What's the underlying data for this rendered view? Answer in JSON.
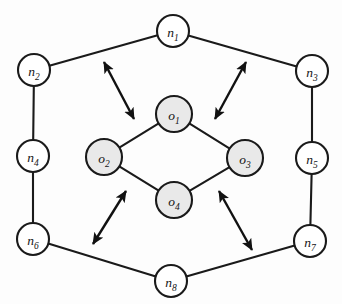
{
  "diagram": {
    "colors": {
      "outer_node_fill": "#ffffff",
      "inner_node_fill": "#e9e9e9",
      "stroke": "#1a1a1a",
      "arrow": "#111111",
      "background": "#fdfdfd"
    },
    "outer_nodes": [
      {
        "id": "n1",
        "base": "n",
        "sub": "1",
        "cx": 173,
        "cy": 31,
        "r": 16
      },
      {
        "id": "n2",
        "base": "n",
        "sub": "2",
        "cx": 34,
        "cy": 70,
        "r": 16
      },
      {
        "id": "n3",
        "base": "n",
        "sub": "3",
        "cx": 312,
        "cy": 71,
        "r": 16
      },
      {
        "id": "n4",
        "base": "n",
        "sub": "4",
        "cx": 33,
        "cy": 156,
        "r": 16
      },
      {
        "id": "n5",
        "base": "n",
        "sub": "5",
        "cx": 312,
        "cy": 158,
        "r": 16
      },
      {
        "id": "n6",
        "base": "n",
        "sub": "6",
        "cx": 33,
        "cy": 239,
        "r": 16
      },
      {
        "id": "n7",
        "base": "n",
        "sub": "7",
        "cx": 310,
        "cy": 241,
        "r": 16
      },
      {
        "id": "n8",
        "base": "n",
        "sub": "8",
        "cx": 171,
        "cy": 281,
        "r": 16
      }
    ],
    "inner_nodes": [
      {
        "id": "o1",
        "base": "o",
        "sub": "1",
        "cx": 174,
        "cy": 114,
        "r": 18
      },
      {
        "id": "o2",
        "base": "o",
        "sub": "2",
        "cx": 104,
        "cy": 157,
        "r": 18
      },
      {
        "id": "o3",
        "base": "o",
        "sub": "3",
        "cx": 245,
        "cy": 158,
        "r": 18
      },
      {
        "id": "o4",
        "base": "o",
        "sub": "4",
        "cx": 174,
        "cy": 200,
        "r": 18
      }
    ],
    "ring_edges": [
      {
        "from": "n2",
        "to": "n1"
      },
      {
        "from": "n1",
        "to": "n3"
      },
      {
        "from": "n2",
        "to": "n4"
      },
      {
        "from": "n3",
        "to": "n5"
      },
      {
        "from": "n4",
        "to": "n6"
      },
      {
        "from": "n5",
        "to": "n7"
      },
      {
        "from": "n6",
        "to": "n8"
      },
      {
        "from": "n8",
        "to": "n7"
      }
    ],
    "diamond_edges": [
      {
        "from": "o1",
        "to": "o2"
      },
      {
        "from": "o1",
        "to": "o3"
      },
      {
        "from": "o2",
        "to": "o4"
      },
      {
        "from": "o3",
        "to": "o4"
      }
    ],
    "relation_arrows": [
      {
        "id": "arrow-top-left",
        "x1": 104,
        "y1": 62,
        "x2": 134,
        "y2": 119,
        "double_headed": true
      },
      {
        "id": "arrow-top-right",
        "x1": 215,
        "y1": 119,
        "x2": 246,
        "y2": 62,
        "double_headed": true
      },
      {
        "id": "arrow-bottom-left",
        "x1": 93,
        "y1": 244,
        "x2": 126,
        "y2": 191,
        "double_headed": true
      },
      {
        "id": "arrow-bottom-right",
        "x1": 219,
        "y1": 191,
        "x2": 252,
        "y2": 250,
        "double_headed": true
      }
    ]
  }
}
